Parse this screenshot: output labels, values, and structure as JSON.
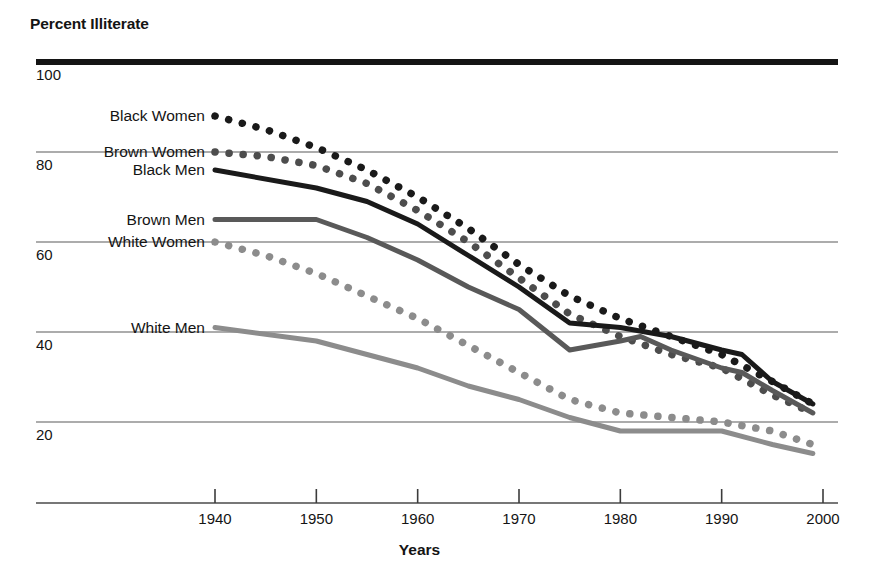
{
  "chart_data": {
    "type": "line",
    "title": "",
    "ylabel": "Percent Illiterate",
    "xlabel": "Years",
    "x_ticks": [
      1940,
      1950,
      1960,
      1970,
      1980,
      1990,
      2000
    ],
    "x_tick_labels": [
      "1940",
      "1950",
      "1960",
      "1970",
      "1980",
      "1990",
      "2000"
    ],
    "y_ticks": [
      100,
      80,
      60,
      40,
      20
    ],
    "y_tick_labels": [
      "100",
      "80",
      "60",
      "40",
      "20"
    ],
    "xlim": [
      1940,
      2000
    ],
    "ylim": [
      8,
      100
    ],
    "grid": "horizontal",
    "legend": "inline-left-of-each-series",
    "series": [
      {
        "name": "Black Women",
        "label": "Black Women",
        "style": "dotted",
        "color": "#1a1a1a",
        "label_x": 1940,
        "label_y": 88,
        "x": [
          1940,
          1945,
          1950,
          1955,
          1960,
          1965,
          1970,
          1975,
          1980,
          1985,
          1990,
          1995,
          1999
        ],
        "values": [
          88,
          85,
          81,
          76,
          70,
          63,
          55,
          48,
          43,
          39,
          35,
          29,
          24
        ]
      },
      {
        "name": "Brown Women",
        "label": "Brown Women",
        "style": "dotted",
        "color": "#4d4d4d",
        "label_x": 1940,
        "label_y": 80,
        "x": [
          1940,
          1945,
          1950,
          1955,
          1960,
          1965,
          1970,
          1975,
          1980,
          1985,
          1990,
          1995,
          1999
        ],
        "values": [
          80,
          79,
          77,
          73,
          67,
          60,
          52,
          44,
          39,
          35,
          32,
          26,
          22
        ]
      },
      {
        "name": "Black Men",
        "label": "Black Men",
        "style": "solid",
        "color": "#1a1a1a",
        "label_x": 1940,
        "label_y": 76,
        "x": [
          1940,
          1950,
          1955,
          1960,
          1965,
          1970,
          1975,
          1980,
          1985,
          1990,
          1992,
          1995,
          1999
        ],
        "values": [
          76,
          72,
          69,
          64,
          57,
          50,
          42,
          41,
          39,
          36,
          35,
          29,
          24
        ]
      },
      {
        "name": "Brown Men",
        "label": "Brown Men",
        "style": "solid",
        "color": "#595959",
        "label_x": 1940,
        "label_y": 65,
        "x": [
          1940,
          1950,
          1955,
          1960,
          1965,
          1970,
          1975,
          1980,
          1982,
          1985,
          1990,
          1992,
          1995,
          1999
        ],
        "values": [
          65,
          65,
          61,
          56,
          50,
          45,
          36,
          38,
          39,
          36,
          32,
          31,
          27,
          22
        ]
      },
      {
        "name": "White Women",
        "label": "White Women",
        "style": "dotted",
        "color": "#8c8c8c",
        "label_x": 1940,
        "label_y": 60,
        "x": [
          1940,
          1945,
          1950,
          1955,
          1960,
          1965,
          1970,
          1975,
          1980,
          1985,
          1990,
          1995,
          1999
        ],
        "values": [
          60,
          57,
          53,
          48,
          43,
          37,
          31,
          25,
          22,
          21,
          20,
          18,
          15
        ]
      },
      {
        "name": "White Men",
        "label": "White Men",
        "style": "solid",
        "color": "#8c8c8c",
        "label_x": 1940,
        "label_y": 41,
        "x": [
          1940,
          1950,
          1955,
          1960,
          1965,
          1970,
          1975,
          1980,
          1985,
          1990,
          1995,
          1999
        ],
        "values": [
          41,
          38,
          35,
          32,
          28,
          25,
          21,
          18,
          18,
          18,
          15,
          13
        ]
      }
    ]
  }
}
